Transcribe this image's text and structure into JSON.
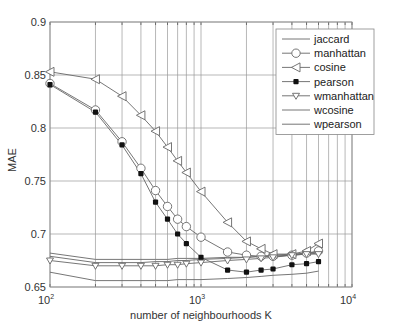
{
  "chart_data": {
    "type": "line",
    "title": "",
    "xlabel": "number of neighbourhoods K",
    "ylabel": "MAE",
    "xscale": "log",
    "xlim": [
      100,
      10000
    ],
    "ylim": [
      0.65,
      0.9
    ],
    "grid": true,
    "legend_position": "upper right",
    "x_tick_labels": [
      "10^2",
      "10^3",
      "10^4"
    ],
    "y_tick_labels": [
      "0.65",
      "0.7",
      "0.75",
      "0.8",
      "0.85",
      "0.9"
    ],
    "x": [
      100,
      200,
      300,
      400,
      500,
      600,
      700,
      800,
      1000,
      1500,
      2000,
      2500,
      3000,
      4000,
      5000,
      6000
    ],
    "series": [
      {
        "name": "jaccard",
        "marker": "none",
        "values": [
          0.682,
          0.676,
          0.676,
          0.676,
          0.676,
          0.676,
          0.677,
          0.677,
          0.677,
          0.678,
          0.678,
          0.679,
          0.679,
          0.68,
          0.681,
          0.682
        ]
      },
      {
        "name": "manhattan",
        "marker": "circle",
        "values": [
          0.842,
          0.817,
          0.787,
          0.762,
          0.741,
          0.726,
          0.714,
          0.707,
          0.697,
          0.683,
          0.68,
          0.679,
          0.679,
          0.68,
          0.682,
          0.684
        ]
      },
      {
        "name": "cosine",
        "marker": "triangle-left",
        "values": [
          0.853,
          0.846,
          0.83,
          0.812,
          0.797,
          0.782,
          0.769,
          0.758,
          0.74,
          0.711,
          0.693,
          0.686,
          0.681,
          0.681,
          0.684,
          0.691
        ]
      },
      {
        "name": "pearson",
        "marker": "filled-dot",
        "values": [
          0.841,
          0.815,
          0.784,
          0.757,
          0.73,
          0.714,
          0.7,
          0.691,
          0.678,
          0.666,
          0.664,
          0.666,
          0.667,
          0.671,
          0.672,
          0.674
        ]
      },
      {
        "name": "wmanhattan",
        "marker": "triangle-down-check",
        "values": [
          0.675,
          0.67,
          0.67,
          0.67,
          0.67,
          0.671,
          0.671,
          0.672,
          0.673,
          0.675,
          0.676,
          0.677,
          0.678,
          0.68,
          0.681,
          0.681
        ]
      },
      {
        "name": "wcosine",
        "marker": "none",
        "values": [
          0.679,
          0.673,
          0.673,
          0.673,
          0.674,
          0.674,
          0.675,
          0.675,
          0.676,
          0.677,
          0.678,
          0.679,
          0.68,
          0.681,
          0.682,
          0.683
        ]
      },
      {
        "name": "wpearson",
        "marker": "none",
        "values": [
          0.664,
          0.656,
          0.656,
          0.656,
          0.656,
          0.656,
          0.657,
          0.657,
          0.657,
          0.658,
          0.659,
          0.66,
          0.661,
          0.662,
          0.663,
          0.665
        ]
      }
    ]
  },
  "colors": {
    "line": "#666666",
    "grid": "#9a9a9a",
    "axis": "#555555",
    "marker_fill": "#ffffff",
    "filled_marker": "#111111"
  }
}
